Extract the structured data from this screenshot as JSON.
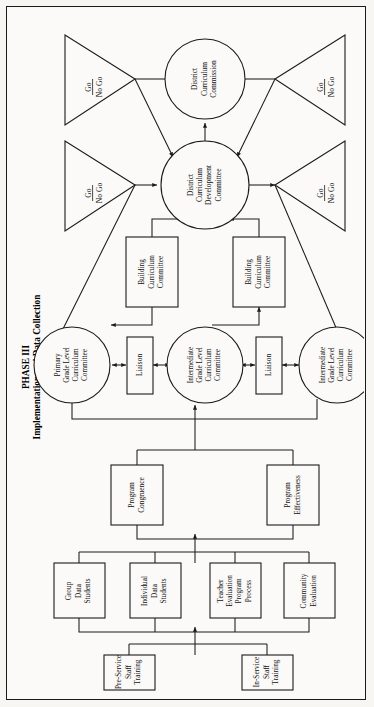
{
  "diagram": {
    "title_line1": "PHASE III",
    "title_line2": "Implementation and Data Collection",
    "orientation": "rotated-90-ccw",
    "border_color": "#1a1a1a",
    "background_color": "#fbfaf8",
    "nodes": {
      "commission": {
        "shape": "circle",
        "lines": [
          "District",
          "Curriculum",
          "Commission"
        ]
      },
      "dev_committee": {
        "shape": "circle",
        "lines": [
          "District",
          "Curriculum",
          "Development",
          "Committee"
        ]
      },
      "gonogo_1": {
        "shape": "triangle",
        "lines": [
          "Go",
          "No Go"
        ],
        "underline_first": true
      },
      "gonogo_2": {
        "shape": "triangle",
        "lines": [
          "Go",
          "No Go"
        ],
        "underline_first": true
      },
      "gonogo_3": {
        "shape": "triangle",
        "lines": [
          "Go",
          "No Go"
        ],
        "underline_first": true
      },
      "gonogo_4": {
        "shape": "triangle",
        "lines": [
          "Go",
          "No Go"
        ],
        "underline_first": true
      },
      "building_cc_left": {
        "shape": "rect",
        "lines": [
          "Building",
          "Curriculum",
          "Committee"
        ]
      },
      "building_cc_right": {
        "shape": "rect",
        "lines": [
          "Building",
          "Curriculum",
          "Committee"
        ]
      },
      "primary_glcc": {
        "shape": "circle",
        "lines": [
          "Primary",
          "Grade Level",
          "Curriculum",
          "Committee"
        ]
      },
      "intermediate_glcc_1": {
        "shape": "circle",
        "lines": [
          "Intermediate",
          "Grade Level",
          "Curriculum",
          "Committee"
        ]
      },
      "intermediate_glcc_2": {
        "shape": "circle",
        "lines": [
          "Intermediate",
          "Grade Level",
          "Curriculum",
          "Committee"
        ]
      },
      "liaison_1": {
        "shape": "rect",
        "lines": [
          "Liaison"
        ]
      },
      "liaison_2": {
        "shape": "rect",
        "lines": [
          "Liaison"
        ]
      },
      "program_congruence": {
        "shape": "rect",
        "lines": [
          "Program",
          "Congruence"
        ]
      },
      "program_effectiveness": {
        "shape": "rect",
        "lines": [
          "Program",
          "Effectiveness"
        ]
      },
      "group_data_students": {
        "shape": "rect",
        "lines": [
          "Group",
          "Data",
          "Students"
        ]
      },
      "individual_data_students": {
        "shape": "rect",
        "lines": [
          "Individual",
          "Data",
          "Students"
        ]
      },
      "teacher_evaluation": {
        "shape": "rect",
        "lines": [
          "Teacher",
          "Evaluation",
          "Program",
          "Process"
        ]
      },
      "community_evaluation": {
        "shape": "rect",
        "lines": [
          "Community",
          "Evaluation"
        ]
      },
      "pre_service_training": {
        "shape": "rect",
        "lines": [
          "Pre-Service",
          "Staff",
          "Training"
        ]
      },
      "in_service_training": {
        "shape": "rect",
        "lines": [
          "In-Service",
          "Staff",
          "Training"
        ]
      }
    }
  }
}
